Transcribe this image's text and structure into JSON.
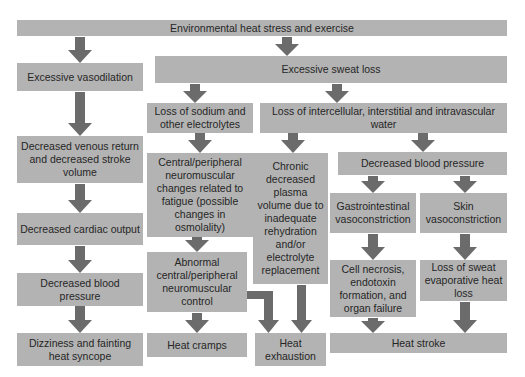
{
  "diagram": {
    "colors": {
      "box": "#b3b3b3",
      "arrow": "#6b6b6b",
      "text": "#262626",
      "background": "#ffffff"
    },
    "nodes": {
      "root": "Environmental heat stress and exercise",
      "vasodilation": "Excessive vasodilation",
      "sweat_loss": "Excessive sweat loss",
      "sodium_loss": "Loss of sodium and other electrolytes",
      "water_loss": "Loss of intercellular, interstitial and intravascular water",
      "venous_return": "Decreased venous return and decreased stroke volume",
      "neuromuscular_changes": "Central/peripheral neuromuscular changes related to fatigue (possible changes in osmolality)",
      "chronic_plasma": "Chronic decreased plasma volume due to inadequate rehydration and/or electrolyte replacement",
      "decreased_bp_right": "Decreased blood pressure",
      "cardiac_output": "Decreased cardiac output",
      "gi_vasoconstriction": "Gastrointestinal vasoconstriction",
      "skin_vasoconstriction": "Skin vasoconstriction",
      "decreased_bp_left": "Decreased blood pressure",
      "abnormal_control": "Abnormal central/peripheral neuromuscular control",
      "cell_necrosis": "Cell necrosis, endotoxin formation, and organ failure",
      "sweat_evap_loss": "Loss of sweat evaporative heat loss",
      "syncope": "Dizziness and fainting heat syncope",
      "cramps": "Heat cramps",
      "exhaustion": "Heat exhaustion",
      "stroke": "Heat stroke"
    },
    "edges": [
      [
        "root",
        "vasodilation"
      ],
      [
        "root",
        "sweat_loss"
      ],
      [
        "sweat_loss",
        "sodium_loss"
      ],
      [
        "sweat_loss",
        "water_loss"
      ],
      [
        "vasodilation",
        "venous_return"
      ],
      [
        "venous_return",
        "cardiac_output"
      ],
      [
        "cardiac_output",
        "decreased_bp_left"
      ],
      [
        "decreased_bp_left",
        "syncope"
      ],
      [
        "sodium_loss",
        "neuromuscular_changes"
      ],
      [
        "neuromuscular_changes",
        "abnormal_control"
      ],
      [
        "abnormal_control",
        "cramps"
      ],
      [
        "abnormal_control",
        "exhaustion"
      ],
      [
        "water_loss",
        "chronic_plasma"
      ],
      [
        "chronic_plasma",
        "exhaustion"
      ],
      [
        "water_loss",
        "decreased_bp_right"
      ],
      [
        "decreased_bp_right",
        "gi_vasoconstriction"
      ],
      [
        "decreased_bp_right",
        "skin_vasoconstriction"
      ],
      [
        "gi_vasoconstriction",
        "cell_necrosis"
      ],
      [
        "skin_vasoconstriction",
        "sweat_evap_loss"
      ],
      [
        "cell_necrosis",
        "stroke"
      ],
      [
        "sweat_evap_loss",
        "stroke"
      ]
    ]
  }
}
